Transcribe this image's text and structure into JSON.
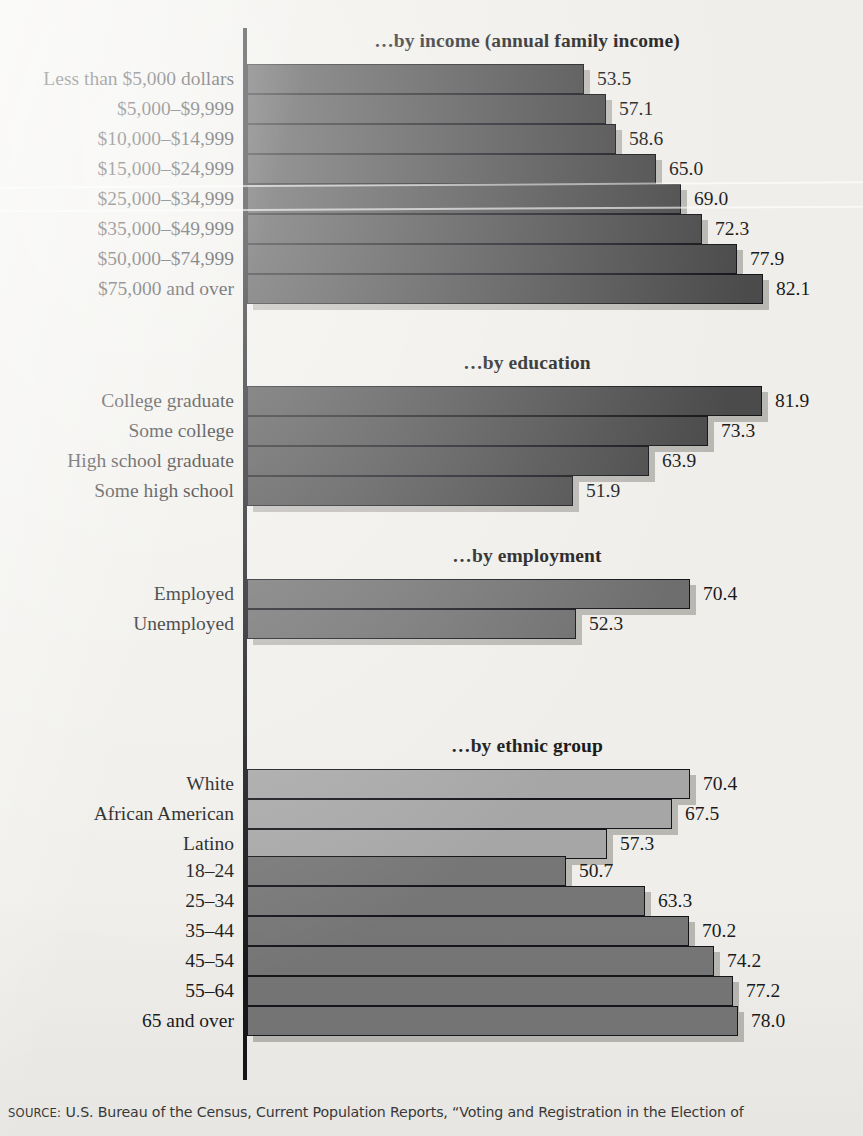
{
  "source_note": {
    "keyword": "SOURCE:",
    "text": "U.S. Bureau of the Census, Current Population Reports, “Voting and Registration in the Election of"
  },
  "chart_data": {
    "type": "bar",
    "orientation": "horizontal",
    "title": "",
    "xlabel": "",
    "ylabel": "",
    "xlim": [
      0,
      90
    ],
    "grid": false,
    "legend": null,
    "value_format": "one decimal place, percent of citizens reporting voting",
    "groups": [
      {
        "title": "…by income (annual family income)",
        "bar_color": "#4b4b4b",
        "categories": [
          "Less than $5,000 dollars",
          "$5,000–$9,999",
          "$10,000–$14,999",
          "$15,000–$24,999",
          "$25,000–$34,999",
          "$35,000–$49,999",
          "$50,000–$74,999",
          "$75,000 and over"
        ],
        "values": [
          53.5,
          57.1,
          58.6,
          65.0,
          69.0,
          72.3,
          77.9,
          82.1
        ]
      },
      {
        "title": "…by education",
        "bar_color": "#4b4b4b",
        "categories": [
          "College graduate",
          "Some college",
          "High school graduate",
          "Some high school"
        ],
        "values": [
          81.9,
          73.3,
          63.9,
          51.9
        ]
      },
      {
        "title": "…by employment",
        "bar_color": "#6e6e6e",
        "categories": [
          "Employed",
          "Unemployed"
        ],
        "values": [
          70.4,
          52.3
        ]
      },
      {
        "title": "…by ethnic group",
        "bar_color": "#a6a6a6",
        "categories": [
          "White",
          "African American",
          "Latino"
        ],
        "values": [
          70.4,
          67.5,
          57.3
        ]
      },
      {
        "title": "…by age",
        "bar_color": "#767676",
        "categories": [
          "18–24",
          "25–34",
          "35–44",
          "45–54",
          "55–64",
          "65 and over"
        ],
        "values": [
          50.7,
          63.3,
          70.2,
          74.2,
          77.2,
          78.0
        ]
      }
    ]
  }
}
